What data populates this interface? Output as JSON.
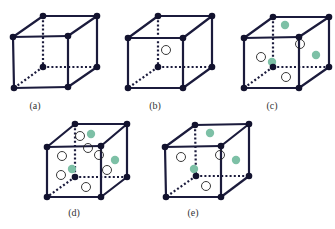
{
  "colors": {
    "edge": "#1b1b3c",
    "vertex": "#12122e",
    "green_atom": "#7dc0a6",
    "open_atom_stroke": "#222222",
    "open_atom_fill": "#ffffff"
  },
  "cubes": [
    {
      "id": "a",
      "label": "(a)",
      "label_pos": [
        35,
        107
      ],
      "corners": {
        "ftl": [
          13,
          37
        ],
        "ftr": [
          68,
          36
        ],
        "fbl": [
          14,
          88
        ],
        "fbr": [
          68,
          87
        ],
        "btl": [
          43,
          16
        ],
        "btr": [
          97,
          16
        ],
        "bbl": [
          43,
          67
        ],
        "bbr": [
          97,
          67
        ]
      },
      "green_atoms": [],
      "open_atoms": []
    },
    {
      "id": "b",
      "label": "(b)",
      "label_pos": [
        155,
        107
      ],
      "corners": {
        "ftl": [
          128,
          38
        ],
        "ftr": [
          183,
          38
        ],
        "fbl": [
          128,
          88
        ],
        "fbr": [
          183,
          88
        ],
        "btl": [
          158,
          16
        ],
        "btr": [
          212,
          16
        ],
        "bbl": [
          158,
          67
        ],
        "bbr": [
          212,
          67
        ]
      },
      "green_atoms": [],
      "open_atoms": [
        [
          166,
          50
        ]
      ]
    },
    {
      "id": "c",
      "label": "(c)",
      "label_pos": [
        272,
        107
      ],
      "corners": {
        "ftl": [
          244,
          38
        ],
        "ftr": [
          299,
          37
        ],
        "fbl": [
          244,
          88
        ],
        "fbr": [
          299,
          88
        ],
        "btl": [
          273,
          17
        ],
        "btr": [
          329,
          17
        ],
        "bbl": [
          273,
          67
        ],
        "bbr": [
          329,
          67
        ]
      },
      "green_atoms": [
        [
          285,
          25
        ],
        [
          316,
          55
        ],
        [
          272,
          62
        ]
      ],
      "open_atoms": [
        [
          261,
          57
        ],
        [
          300,
          44
        ],
        [
          286,
          77
        ]
      ]
    },
    {
      "id": "d",
      "label": "(d)",
      "label_pos": [
        74,
        214
      ],
      "corners": {
        "ftl": [
          47,
          147
        ],
        "ftr": [
          101,
          146
        ],
        "fbl": [
          47,
          197
        ],
        "fbr": [
          101,
          197
        ],
        "btl": [
          75,
          124
        ],
        "btr": [
          127,
          124
        ],
        "bbl": [
          75,
          177
        ],
        "bbr": [
          127,
          177
        ]
      },
      "green_atoms": [
        [
          91,
          134
        ],
        [
          115,
          160
        ],
        [
          72,
          169
        ]
      ],
      "open_atoms": [
        [
          80,
          136
        ],
        [
          62,
          156
        ],
        [
          88,
          148
        ],
        [
          99,
          155
        ],
        [
          61,
          175
        ],
        [
          107,
          170
        ],
        [
          86,
          187
        ]
      ]
    },
    {
      "id": "e",
      "label": "(e)",
      "label_pos": [
        193,
        214
      ],
      "corners": {
        "ftl": [
          165,
          147
        ],
        "ftr": [
          221,
          146
        ],
        "fbl": [
          166,
          197
        ],
        "fbr": [
          221,
          197
        ],
        "btl": [
          195,
          125
        ],
        "btr": [
          249,
          124
        ],
        "bbl": [
          196,
          176
        ],
        "bbr": [
          249,
          176
        ]
      },
      "green_atoms": [
        [
          210,
          133
        ],
        [
          236,
          160
        ],
        [
          194,
          169
        ]
      ],
      "open_atoms": [
        [
          181,
          157
        ],
        [
          220,
          155
        ],
        [
          206,
          186
        ]
      ]
    }
  ]
}
